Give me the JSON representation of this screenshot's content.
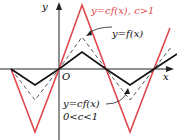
{
  "axes": {
    "x_label": "x",
    "y_label": "y",
    "origin_label": "O"
  },
  "labels": {
    "stretch": "y=cf(x), c>1",
    "original": "y=f(x)",
    "compress_line1": "y=cf(x)",
    "compress_line2": "0<c<1"
  },
  "colors": {
    "axis": "#222222",
    "original": "#111111",
    "stretch": "#e0474c",
    "compress": "#4a5a62"
  },
  "curves": {
    "original": "triangle wave, solid black",
    "stretch": "vertically stretched by c>1, solid red",
    "compress": "intermediate scaled copy, dashed"
  }
}
